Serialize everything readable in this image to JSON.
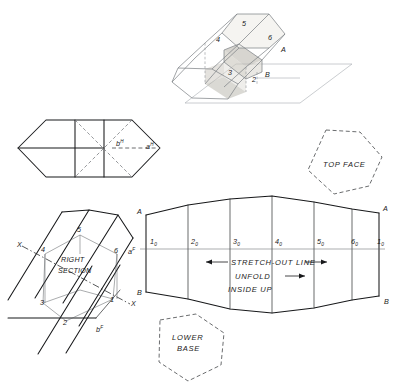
{
  "figure": {
    "background_color": "#ffffff",
    "ink_color": "#17181a"
  },
  "pictorial": {
    "name": "pictorial-view",
    "vertex_labels": [
      {
        "id": "p4",
        "text": "4",
        "x": 216,
        "y": 42
      },
      {
        "id": "p5",
        "text": "5",
        "x": 242,
        "y": 26
      },
      {
        "id": "p6",
        "text": "6",
        "x": 268,
        "y": 40
      },
      {
        "id": "pA",
        "text": "A",
        "x": 281,
        "y": 52
      },
      {
        "id": "p3",
        "text": "3",
        "x": 228,
        "y": 75
      },
      {
        "id": "p2",
        "text": "2",
        "x": 252,
        "y": 82
      },
      {
        "id": "pB",
        "text": "B",
        "x": 265,
        "y": 77
      }
    ]
  },
  "top_view": {
    "name": "top-view-hexagon",
    "labels": [
      {
        "id": "bH",
        "base": "b",
        "sup": "H",
        "x": 116,
        "y": 148
      },
      {
        "id": "aH",
        "base": "a",
        "sup": "H",
        "x": 146,
        "y": 151
      }
    ]
  },
  "right_section": {
    "name": "right-section-view",
    "caption_line1": "RIGHT",
    "caption_line2": "SECTION",
    "axis_label_left": "X",
    "axis_label_right": "X",
    "vertex_labels": [
      {
        "id": "r4",
        "text": "4",
        "x": 41,
        "y": 252
      },
      {
        "id": "r5",
        "text": "5",
        "x": 77,
        "y": 232
      },
      {
        "id": "r6",
        "text": "6",
        "x": 114,
        "y": 253
      },
      {
        "id": "r3",
        "text": "3",
        "x": 40,
        "y": 305
      },
      {
        "id": "r2",
        "text": "2",
        "x": 63,
        "y": 325
      },
      {
        "id": "r1",
        "text": "1",
        "x": 110,
        "y": 302
      }
    ],
    "point_labels": [
      {
        "id": "aF",
        "base": "a",
        "sup": "F",
        "x": 130,
        "y": 252
      },
      {
        "id": "bF",
        "base": "b",
        "sup": "F",
        "x": 98,
        "y": 330
      }
    ]
  },
  "development": {
    "name": "stretch-out-development",
    "stretch_out_label": "STRETCH-OUT LINE",
    "unfold_label": "UNFOLD",
    "inside_up_label": "INSIDE UP",
    "corner_labels": [
      {
        "id": "devA-left",
        "text": "A",
        "x": 139,
        "y": 214
      },
      {
        "id": "devB-left",
        "text": "B",
        "x": 139,
        "y": 294
      },
      {
        "id": "devA-right",
        "text": "A",
        "x": 385,
        "y": 212
      },
      {
        "id": "devB-right",
        "text": "B",
        "x": 386,
        "y": 302
      }
    ],
    "stretch_points": [
      {
        "id": "s1",
        "base": "1",
        "sub": "0",
        "x": 153,
        "y": 244
      },
      {
        "id": "s2",
        "base": "2",
        "sub": "0",
        "x": 192,
        "y": 244
      },
      {
        "id": "s3",
        "base": "3",
        "sub": "0",
        "x": 234,
        "y": 244
      },
      {
        "id": "s4",
        "base": "4",
        "sub": "0",
        "x": 276,
        "y": 244
      },
      {
        "id": "s5",
        "base": "5",
        "sub": "0",
        "x": 318,
        "y": 244
      },
      {
        "id": "s6",
        "base": "6",
        "sub": "0",
        "x": 352,
        "y": 244
      },
      {
        "id": "s1b",
        "base": "1",
        "sub": "0",
        "x": 379,
        "y": 244
      }
    ]
  },
  "top_face": {
    "name": "top-face-pattern",
    "label": "TOP FACE"
  },
  "lower_base": {
    "name": "lower-base-pattern",
    "label_line1": "LOWER",
    "label_line2": "BASE"
  }
}
